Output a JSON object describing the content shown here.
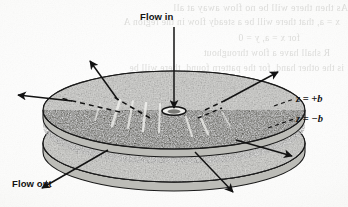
{
  "figure": {
    "name": "radial-flow-between-parallel-disks",
    "caption_labels": {
      "flow_in": "Flow in",
      "flow_out": "Flow out",
      "z_top": "z = +b",
      "z_top_var": "z",
      "z_top_eq": "=",
      "z_top_val": "+b",
      "z_bottom": "z = −b",
      "z_bottom_var": "z",
      "z_bottom_eq": "=",
      "z_bottom_val": "−b"
    },
    "colors": {
      "paper": "#fbfbfa",
      "ink": "#121212",
      "disk_light_fill": "#c6c6c2",
      "gap_dark_fill": "#54544f",
      "ghost_text": "#c9c9c6",
      "outline": "#1a1a1a"
    },
    "elements": {
      "top_disk": "upper parallel disk, light stippled ellipse",
      "bottom_disk": "lower parallel disk, light stippled ellipse",
      "gap_region": "dark stippled annular gap between the two disks",
      "inlet_hole": "small ellipse at centre of top disk where fluid enters",
      "inlet_stem": "vertical inflow line from Flow in label to inlet hole"
    },
    "arrow_count": 8,
    "ghost_text_lines": [
      "As then there will be no flow away at all",
      "x = a, that there will be a steady flow in the region A",
      "for x = a, y = 0",
      "R shall have a flow throughout",
      "is the other hand, for the pattern found, there will be"
    ]
  }
}
